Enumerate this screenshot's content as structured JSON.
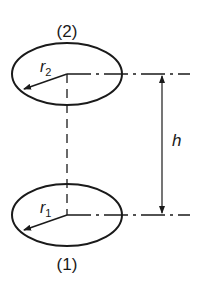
{
  "diagram": {
    "sections": [
      {
        "id": "2",
        "label": "(2)",
        "radius_symbol": "r",
        "radius_subscript": "2"
      },
      {
        "id": "1",
        "label": "(1)",
        "radius_symbol": "r",
        "radius_subscript": "1"
      }
    ],
    "dimension": {
      "symbol": "h"
    },
    "colors": {
      "stroke": "#1a1a1a",
      "background": "#ffffff"
    }
  }
}
